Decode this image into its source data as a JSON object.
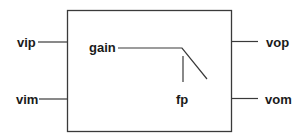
{
  "diagram": {
    "block": {
      "x": 67,
      "y": 10,
      "width": 164,
      "height": 121,
      "stroke": "#3a3a3a"
    },
    "ports": {
      "inputs": [
        {
          "label": "vip"
        },
        {
          "label": "vim"
        }
      ],
      "outputs": [
        {
          "label": "vop"
        },
        {
          "label": "vom"
        }
      ]
    },
    "transfer_function": {
      "gain_label": "gain",
      "pole_label": "fp"
    },
    "line_color": "#3a3a3a",
    "text_color": "#1a1a1a"
  }
}
